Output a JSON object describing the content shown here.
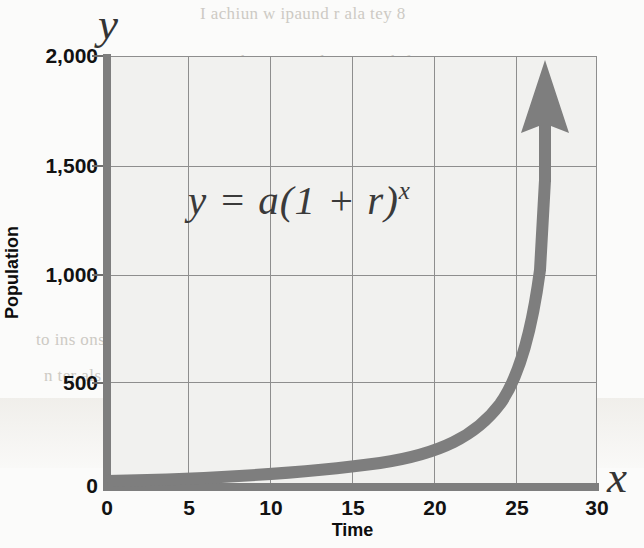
{
  "chart_data": {
    "type": "line",
    "title": "",
    "subtitle": "",
    "xlabel": "Time",
    "ylabel": "Population",
    "axis_letters": {
      "x": "x",
      "y": "y"
    },
    "annotation": {
      "equation_base": "y = a(1 + r)",
      "equation_exponent": "x",
      "equation_full": "y = a(1 + r)^x"
    },
    "xlim": [
      0,
      30
    ],
    "ylim": [
      0,
      2000
    ],
    "xticks": [
      "0",
      "5",
      "10",
      "15",
      "20",
      "25",
      "30"
    ],
    "yticks": [
      "0",
      "500",
      "1,000",
      "1,500",
      "2,000"
    ],
    "xtick_values": [
      0,
      5,
      10,
      15,
      20,
      25,
      30
    ],
    "ytick_values": [
      0,
      500,
      1000,
      1500,
      2000
    ],
    "grid": true,
    "legend": "none",
    "series": [
      {
        "name": "exponential growth",
        "x": [
          0,
          2,
          4,
          6,
          8,
          10,
          12,
          14,
          16,
          18,
          20,
          21,
          22,
          23,
          24,
          25,
          26,
          26.5
        ],
        "values": [
          10,
          13,
          17,
          23,
          30,
          40,
          53,
          70,
          93,
          123,
          163,
          188,
          216,
          249,
          287,
          330,
          380,
          408
        ]
      }
    ],
    "series_note": "curve rises from near 0, crosses 500 at x≈24.3 and 1,000 at x≈25.3, exiting top of plot near x≈26.5 as an upward arrow",
    "colors": {
      "curve": "#7e7e7e",
      "axis": "#7e7e7e",
      "gridline": "#8e8e8e",
      "plot_background": "#f1f1ef",
      "page_background": "#fbfbfa",
      "text": "#121212",
      "equation_text": "#3a3a3a"
    }
  },
  "scan_bleed": {
    "lines": [
      {
        "text": "I achiun  w  ipaund  r   ala  tey 8",
        "x": 200,
        "y": 4
      },
      {
        "text": "with on even that we  1 th  ferrom",
        "x": 218,
        "y": 52
      },
      {
        "text": "ourwy  gnoke,  irst corr  ler  ters a",
        "x": 222,
        "y": 84
      },
      {
        "text": "dditurch issuall upasns wne actinpel",
        "x": 204,
        "y": 116
      },
      {
        "text": "sue  unsount tha  ins  tre  scr  a r",
        "x": 196,
        "y": 146
      },
      {
        "text": "on  ur  ne  ate  ronn  uns  35 neunne",
        "x": 194,
        "y": 176
      },
      {
        "text": "r tasiest  read  n of  an in:lipulstr",
        "x": 200,
        "y": 206
      },
      {
        "text": "on  s 7  uations  hee  Chapt  land  ra",
        "x": 202,
        "y": 240
      },
      {
        "text": "the Rulhap  n  sithout   eeslt  ing   aho",
        "x": 198,
        "y": 272
      },
      {
        "text": "I  s  riti  n  in  a  v  n  t",
        "x": 358,
        "y": 304
      },
      {
        "text": "e  Raltrigh  r  show",
        "x": 362,
        "y": 340
      },
      {
        "text": "to  ins  ons e  wn  ue",
        "x": 36,
        "y": 330
      },
      {
        "text": "n  ter  als  n  he",
        "x": 44,
        "y": 366
      }
    ]
  }
}
